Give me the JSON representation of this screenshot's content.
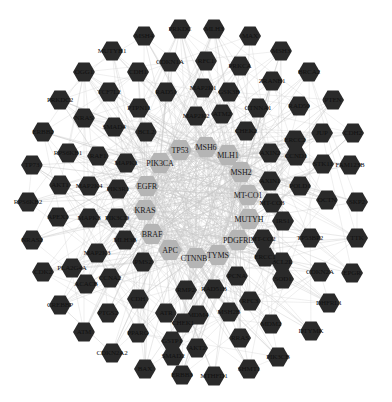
{
  "diagram": {
    "type": "protein-protein interaction network",
    "colors": {
      "core_node": "#b5b5b5",
      "outer_node": "#2a2a2a",
      "edge": "#c8c8c8",
      "background": "#ffffff"
    },
    "core_nodes": [
      {
        "label": "TP53",
        "x": 180,
        "y": 150
      },
      {
        "label": "MSH6",
        "x": 206,
        "y": 147
      },
      {
        "label": "MLH1",
        "x": 228,
        "y": 155
      },
      {
        "label": "PIK3CA",
        "x": 160,
        "y": 163
      },
      {
        "label": "MSH2",
        "x": 241,
        "y": 172
      },
      {
        "label": "EGFR",
        "x": 147,
        "y": 186
      },
      {
        "label": "MT-CO1",
        "x": 248,
        "y": 195
      },
      {
        "label": "KRAS",
        "x": 145,
        "y": 210
      },
      {
        "label": "MUTYH",
        "x": 249,
        "y": 219
      },
      {
        "label": "BRAF",
        "x": 152,
        "y": 234
      },
      {
        "label": "PDGFRL",
        "x": 238,
        "y": 240
      },
      {
        "label": "APC",
        "x": 170,
        "y": 250
      },
      {
        "label": "CTNNB1",
        "x": 196,
        "y": 258
      },
      {
        "label": "TYMS",
        "x": 218,
        "y": 255
      }
    ],
    "outer_nodes": [
      {
        "label": "PRKDC",
        "x": 180,
        "y": 29
      },
      {
        "label": "MLH3",
        "x": 214,
        "y": 29
      },
      {
        "label": "MSH4",
        "x": 144,
        "y": 36
      },
      {
        "label": "MAX",
        "x": 250,
        "y": 36
      },
      {
        "label": "MUTYH1",
        "x": 112,
        "y": 51
      },
      {
        "label": "CDKN1A",
        "x": 170,
        "y": 62
      },
      {
        "label": "RFC1",
        "x": 206,
        "y": 61
      },
      {
        "label": "MSH3",
        "x": 281,
        "y": 51
      },
      {
        "label": "OGG1",
        "x": 84,
        "y": 72
      },
      {
        "label": "CDH1",
        "x": 138,
        "y": 72
      },
      {
        "label": "PRKCA",
        "x": 240,
        "y": 66
      },
      {
        "label": "ZRANB1",
        "x": 272,
        "y": 81
      },
      {
        "label": "BRCA2",
        "x": 309,
        "y": 72
      },
      {
        "label": "PRKDC2",
        "x": 60,
        "y": 100
      },
      {
        "label": "TCF7L2",
        "x": 109,
        "y": 92
      },
      {
        "label": "RAD51",
        "x": 166,
        "y": 92
      },
      {
        "label": "MAP2K1",
        "x": 203,
        "y": 88
      },
      {
        "label": "GSK3B",
        "x": 229,
        "y": 92
      },
      {
        "label": "CTNNA1",
        "x": 258,
        "y": 108
      },
      {
        "label": "RAD50",
        "x": 299,
        "y": 106
      },
      {
        "label": "PTEN",
        "x": 333,
        "y": 100
      },
      {
        "label": "PTPN11",
        "x": 139,
        "y": 108
      },
      {
        "label": "ERBB2",
        "x": 43,
        "y": 132
      },
      {
        "label": "NRAS",
        "x": 84,
        "y": 118
      },
      {
        "label": "SMAD4",
        "x": 114,
        "y": 127
      },
      {
        "label": "MAP2K2",
        "x": 196,
        "y": 116
      },
      {
        "label": "ATM2",
        "x": 222,
        "y": 114
      },
      {
        "label": "ERCC2",
        "x": 295,
        "y": 140
      },
      {
        "label": "JUP",
        "x": 322,
        "y": 133
      },
      {
        "label": "CDH2",
        "x": 353,
        "y": 133
      },
      {
        "label": "BCL2",
        "x": 146,
        "y": 132
      },
      {
        "label": "CHEK2",
        "x": 246,
        "y": 131
      },
      {
        "label": "RPS6KB1",
        "x": 68,
        "y": 153
      },
      {
        "label": "RAF1",
        "x": 98,
        "y": 156
      },
      {
        "label": "MAPK1",
        "x": 126,
        "y": 163
      },
      {
        "label": "AXIN2",
        "x": 270,
        "y": 153
      },
      {
        "label": "CCND1",
        "x": 296,
        "y": 156
      },
      {
        "label": "STK11",
        "x": 323,
        "y": 164
      },
      {
        "label": "FAM123B",
        "x": 350,
        "y": 165
      },
      {
        "label": "TP73",
        "x": 32,
        "y": 165
      },
      {
        "label": "AKT1",
        "x": 60,
        "y": 185
      },
      {
        "label": "MAP2K4",
        "x": 89,
        "y": 186
      },
      {
        "label": "PIK3R1",
        "x": 118,
        "y": 189
      },
      {
        "label": "AXIN1",
        "x": 270,
        "y": 181
      },
      {
        "label": "POLD1",
        "x": 300,
        "y": 186
      },
      {
        "label": "RPS6KB2",
        "x": 28,
        "y": 202
      },
      {
        "label": "APEX1",
        "x": 58,
        "y": 217
      },
      {
        "label": "MAPK3",
        "x": 89,
        "y": 218
      },
      {
        "label": "PIK3CD",
        "x": 117,
        "y": 218
      },
      {
        "label": "MT-CO3",
        "x": 272,
        "y": 203
      },
      {
        "label": "OCTN",
        "x": 327,
        "y": 200
      },
      {
        "label": "SKP2",
        "x": 357,
        "y": 202
      },
      {
        "label": "NRAS2",
        "x": 32,
        "y": 240
      },
      {
        "label": "MAP2K3",
        "x": 97,
        "y": 253
      },
      {
        "label": "MLH3B",
        "x": 125,
        "y": 240
      },
      {
        "label": "IRS1",
        "x": 283,
        "y": 221
      },
      {
        "label": "MT-CO2",
        "x": 263,
        "y": 239
      },
      {
        "label": "TP53BP2",
        "x": 310,
        "y": 238
      },
      {
        "label": "TTK",
        "x": 357,
        "y": 238
      },
      {
        "label": "CDK2",
        "x": 43,
        "y": 272
      },
      {
        "label": "PLA2G4A",
        "x": 72,
        "y": 268
      },
      {
        "label": "PMS2",
        "x": 143,
        "y": 262
      },
      {
        "label": "BCL2L",
        "x": 282,
        "y": 262
      },
      {
        "label": "ERCC1",
        "x": 265,
        "y": 257
      },
      {
        "label": "ACACB",
        "x": 86,
        "y": 284
      },
      {
        "label": "CCNA2",
        "x": 110,
        "y": 278
      },
      {
        "label": "PCNA",
        "x": 237,
        "y": 276
      },
      {
        "label": "SOD1",
        "x": 283,
        "y": 279
      },
      {
        "label": "CDKN2A",
        "x": 320,
        "y": 272
      },
      {
        "label": "EPGR",
        "x": 352,
        "y": 273
      },
      {
        "label": "CREBBP",
        "x": 60,
        "y": 305
      },
      {
        "label": "CDH",
        "x": 138,
        "y": 299
      },
      {
        "label": "RMP2",
        "x": 186,
        "y": 290
      },
      {
        "label": "RAD51B",
        "x": 214,
        "y": 289
      },
      {
        "label": "RFC3",
        "x": 250,
        "y": 301
      },
      {
        "label": "DHFRL1",
        "x": 329,
        "y": 303
      },
      {
        "label": "PTGS2",
        "x": 108,
        "y": 313
      },
      {
        "label": "ATR",
        "x": 166,
        "y": 313
      },
      {
        "label": "MSH2B",
        "x": 229,
        "y": 312
      },
      {
        "label": "MDM4",
        "x": 198,
        "y": 315
      },
      {
        "label": "CHEK1",
        "x": 183,
        "y": 323
      },
      {
        "label": "ATM",
        "x": 84,
        "y": 332
      },
      {
        "label": "PPARG",
        "x": 138,
        "y": 333
      },
      {
        "label": "GSTP1",
        "x": 172,
        "y": 341
      },
      {
        "label": "MDM2",
        "x": 271,
        "y": 324
      },
      {
        "label": "DTYMK",
        "x": 311,
        "y": 331
      },
      {
        "label": "CDKN2A2",
        "x": 112,
        "y": 353
      },
      {
        "label": "AKT2",
        "x": 197,
        "y": 348
      },
      {
        "label": "RRAS",
        "x": 240,
        "y": 338
      },
      {
        "label": "SMAD2",
        "x": 173,
        "y": 356
      },
      {
        "label": "PIK3CB",
        "x": 278,
        "y": 357
      },
      {
        "label": "BAX",
        "x": 145,
        "y": 369
      },
      {
        "label": "ERBB3",
        "x": 182,
        "y": 375
      },
      {
        "label": "MTHFD1",
        "x": 214,
        "y": 376
      },
      {
        "label": "SHMT1",
        "x": 249,
        "y": 369
      }
    ]
  }
}
